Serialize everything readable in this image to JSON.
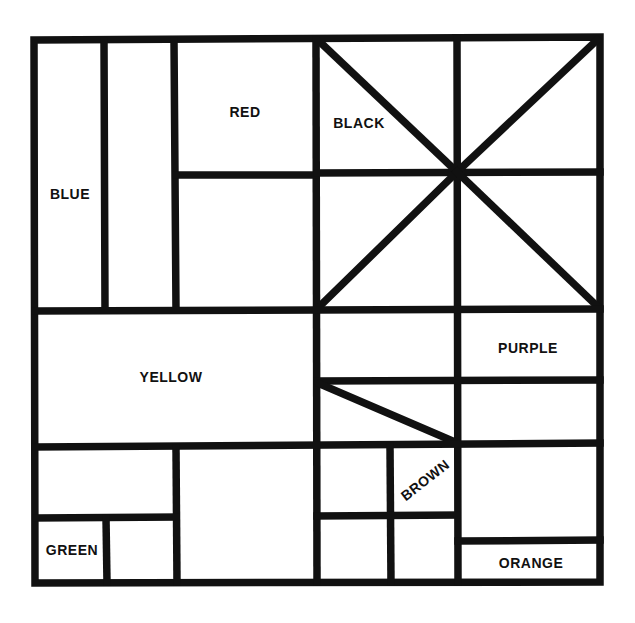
{
  "diagram": {
    "line_color": "#111111",
    "background_color": "#ffffff",
    "labels": {
      "blue": "BLUE",
      "red": "RED",
      "black": "BLACK",
      "yellow": "YELLOW",
      "purple": "PURPLE",
      "brown": "BROWN",
      "green": "GREEN",
      "orange": "ORANGE"
    }
  }
}
